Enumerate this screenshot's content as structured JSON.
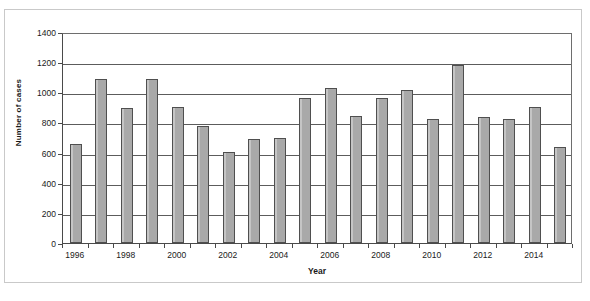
{
  "chart_data": {
    "type": "bar",
    "title": "",
    "xlabel": "Year",
    "ylabel": "Number of cases",
    "categories": [
      "1996",
      "1997",
      "1998",
      "1999",
      "2000",
      "2001",
      "2002",
      "2003",
      "2004",
      "2005",
      "2006",
      "2007",
      "2008",
      "2009",
      "2010",
      "2011",
      "2012",
      "2013",
      "2014",
      "2015"
    ],
    "values": [
      655,
      1090,
      895,
      1090,
      905,
      775,
      605,
      690,
      700,
      960,
      1030,
      845,
      965,
      1015,
      820,
      1180,
      835,
      820,
      905,
      640
    ],
    "ylim": [
      0,
      1400
    ],
    "ytick_values": [
      0,
      200,
      400,
      600,
      800,
      1000,
      1200,
      1400
    ],
    "ytick_labels": [
      "0",
      "200",
      "400",
      "600",
      "800",
      "1000",
      "1200",
      "1400"
    ],
    "xtick_labels": [
      "1996",
      "1998",
      "2000",
      "2002",
      "2004",
      "2006",
      "2008",
      "2010",
      "2012",
      "2014"
    ],
    "grid": true,
    "legend": false,
    "legend_position": "none",
    "bar_color": "#a9a9a9",
    "bar_edge_color": "#4f4f4f",
    "gridline_color": "#5c5c5c",
    "axis_color": "#4a4a4a"
  },
  "caption": ""
}
